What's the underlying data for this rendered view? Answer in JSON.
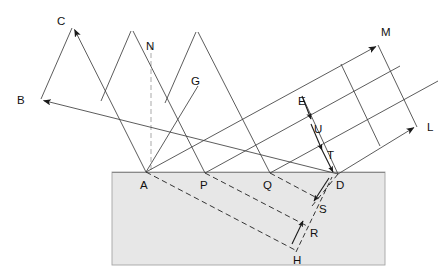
{
  "figure": {
    "type": "optics-ray-wavefront-diagram",
    "canvas": {
      "width": 448,
      "height": 277
    },
    "background_color": "#ffffff",
    "line_color": "#3a3a3a",
    "dashed_color": "#2b2b2b",
    "normal_color": "#b9b9b9",
    "medium": {
      "name": "denser-medium-slab",
      "fill_color": "#e7e7e7",
      "border_color": "#9a9a9a",
      "x": 112,
      "y": 172,
      "width": 273,
      "height": 93
    }
  },
  "labels": {
    "C": "C",
    "B": "B",
    "N": "N",
    "G": "G",
    "M": "M",
    "E": "E",
    "U": "U",
    "L": "L",
    "T": "T",
    "A": "A",
    "P": "P",
    "Q": "Q",
    "D": "D",
    "S": "S",
    "R": "R",
    "H": "H"
  },
  "label_positions": {
    "C": {
      "x": 57,
      "y": 21
    },
    "B": {
      "x": 18,
      "y": 101
    },
    "N": {
      "x": 146,
      "y": 47
    },
    "G": {
      "x": 192,
      "y": 84
    },
    "M": {
      "x": 382,
      "y": 33
    },
    "E": {
      "x": 299,
      "y": 104
    },
    "U": {
      "x": 313,
      "y": 130
    },
    "L": {
      "x": 427,
      "y": 130
    },
    "T": {
      "x": 327,
      "y": 157
    },
    "A": {
      "x": 141,
      "y": 186
    },
    "P": {
      "x": 200,
      "y": 186
    },
    "Q": {
      "x": 264,
      "y": 186
    },
    "D": {
      "x": 336,
      "y": 186
    },
    "S": {
      "x": 319,
      "y": 210
    },
    "R": {
      "x": 310,
      "y": 234
    },
    "H": {
      "x": 294,
      "y": 261
    }
  },
  "geometry": {
    "incident_rays": [
      {
        "name": "incident-ray-1-to-A",
        "x1": 72,
        "y1": 28,
        "x2": 146,
        "y2": 172
      },
      {
        "name": "incident-ray-2-to-P",
        "x1": 131,
        "y1": 31,
        "x2": 205,
        "y2": 173
      },
      {
        "name": "incident-ray-3-to-Q",
        "x1": 196,
        "y1": 32,
        "x2": 270,
        "y2": 173
      },
      {
        "name": "incident-ray-4-from-B-to-D",
        "x1": 41,
        "y1": 99,
        "x2": 338,
        "y2": 174
      }
    ],
    "incident_wavefronts": [
      {
        "name": "incident-wavefront-CB",
        "x1": 72,
        "y1": 28,
        "x2": 41,
        "y2": 99
      },
      {
        "name": "incident-wavefront-2",
        "x1": 131,
        "y1": 31,
        "x2": 101,
        "y2": 101
      },
      {
        "name": "incident-wavefront-3",
        "x1": 196,
        "y1": 32,
        "x2": 164,
        "y2": 103
      },
      {
        "name": "incident-wavefront-G-A",
        "x1": 198,
        "y1": 86,
        "x2": 146,
        "y2": 172
      }
    ],
    "reflected_rays": [
      {
        "name": "reflected-ray-A-to-M",
        "x1": 146,
        "y1": 172,
        "x2": 378,
        "y2": 45
      },
      {
        "name": "reflected-ray-P-to-upper",
        "x1": 205,
        "y1": 173,
        "x2": 400,
        "y2": 84
      },
      {
        "name": "reflected-ray-Q-to-upper",
        "x1": 270,
        "y1": 173,
        "x2": 415,
        "y2": 107
      },
      {
        "name": "reflected-ray-D-to-L",
        "x1": 338,
        "y1": 174,
        "x2": 416,
        "y2": 126
      }
    ],
    "reflected_wavefronts": [
      {
        "name": "reflected-wavefront-M-L",
        "x1": 378,
        "y1": 45,
        "x2": 416,
        "y2": 126
      },
      {
        "name": "reflected-wavefront-mid-1",
        "x1": 341,
        "y1": 64,
        "x2": 379,
        "y2": 144
      },
      {
        "name": "reflected-wavefront-mid-2",
        "x1": 303,
        "y1": 98,
        "x2": 338,
        "y2": 174
      },
      {
        "name": "reflected-wavefront-E-D",
        "x1": 303,
        "y1": 98,
        "x2": 338,
        "y2": 174
      }
    ],
    "refracted_rays": [
      {
        "name": "refracted-ray-A-to-H",
        "x1": 146,
        "y1": 172,
        "x2": 296,
        "y2": 250
      },
      {
        "name": "refracted-ray-P-to-R",
        "x1": 205,
        "y1": 173,
        "x2": 308,
        "y2": 225
      },
      {
        "name": "refracted-ray-Q-to-S",
        "x1": 270,
        "y1": 173,
        "x2": 316,
        "y2": 200
      },
      {
        "name": "refracted-ray-D-short",
        "x1": 338,
        "y1": 174,
        "x2": 314,
        "y2": 205
      }
    ],
    "refracted_wavefronts": [
      {
        "name": "refracted-wavefront-H-D",
        "x1": 296,
        "y1": 250,
        "x2": 314,
        "y2": 203
      },
      {
        "name": "refracted-wavefront-R",
        "x1": 308,
        "y1": 225,
        "x2": 316,
        "y2": 200
      }
    ],
    "normal_line": {
      "name": "normal-at-A",
      "x1": 151,
      "y1": 45,
      "x2": 151,
      "y2": 172
    },
    "arrowheads": [
      {
        "name": "arrowhead-C",
        "x": 72,
        "y": 28,
        "angle": 207
      },
      {
        "name": "arrowhead-B",
        "x": 41,
        "y": 99,
        "angle": 207
      },
      {
        "name": "arrowhead-M",
        "x": 378,
        "y": 45,
        "angle": 332
      },
      {
        "name": "arrowhead-L",
        "x": 416,
        "y": 126,
        "angle": 332
      },
      {
        "name": "arrowhead-E-down",
        "x": 312,
        "y": 121,
        "angle": 70
      },
      {
        "name": "arrowhead-T-down",
        "x": 331,
        "y": 168,
        "angle": 70
      },
      {
        "name": "arrowhead-S-down",
        "x": 313,
        "y": 203,
        "angle": 128
      },
      {
        "name": "arrowhead-R-up",
        "x": 304,
        "y": 220,
        "angle": 308
      }
    ]
  }
}
